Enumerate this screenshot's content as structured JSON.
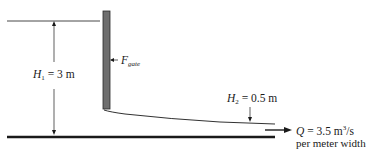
{
  "diagram": {
    "type": "sluice-gate flow schematic",
    "colors": {
      "line": "#1a1a1a",
      "gate_fill": "#6e6e6e",
      "background": "#ffffff"
    },
    "labels": {
      "h1": {
        "symbol": "H",
        "subscript": "1",
        "value": " = 3 m"
      },
      "h2": {
        "symbol": "H",
        "subscript": "2",
        "value": " = 0.5 m"
      },
      "force": {
        "symbol": "F",
        "subscript": "gate"
      },
      "flow": {
        "symbol": "Q",
        "value": " = 3.5 m",
        "superscript": "3",
        "unit_tail": "/s",
        "note": "per meter width"
      }
    }
  }
}
